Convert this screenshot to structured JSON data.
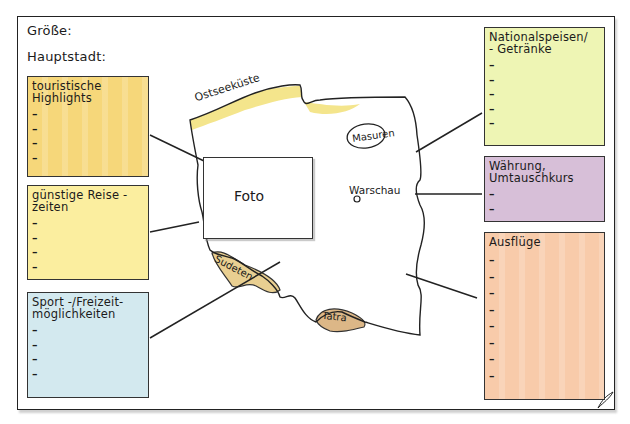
{
  "header": {
    "size_label": "Größe:",
    "capital_label": "Hauptstadt:"
  },
  "colors": {
    "highlights": "#f6d77a",
    "travel_times": "#fbee9f",
    "sport": "#d3e9ef",
    "food": "#eef5b4",
    "currency": "#d7bfd8",
    "excursions": "#f8cbaa",
    "coast": "#f4e58c",
    "mountains": "#e9cf91",
    "outline": "#222222"
  },
  "boxes": {
    "highlights": {
      "title": "touristische\nHighlights",
      "bullets": [
        "–",
        "–",
        "–",
        "–"
      ]
    },
    "travel_times": {
      "title": "günstige Reise -\nzeiten",
      "bullets": [
        "–",
        "–",
        "–",
        "–"
      ]
    },
    "sport": {
      "title": "Sport -/Freizeit-\nmöglichkeiten",
      "bullets": [
        "–",
        "–",
        "–",
        "–"
      ]
    },
    "food": {
      "title": "Nationalspeisen/\n- Getränke",
      "bullets": [
        "–",
        "–",
        "–",
        "–",
        "–"
      ]
    },
    "currency": {
      "title": "Währung,\nUmtauschkurs",
      "bullets": [
        "–",
        "–"
      ]
    },
    "excursions": {
      "title": "Ausflüge",
      "bullets": [
        "–",
        "–",
        "–",
        "–",
        "–",
        "–",
        "–",
        "–"
      ]
    }
  },
  "map": {
    "photo_label": "Foto",
    "coast_label": "Ostseeküste",
    "lakes_label": "Masuren",
    "capital_label": "Warschau",
    "sudeten_label": "Sudeten",
    "tatra_label": "Tatra"
  }
}
